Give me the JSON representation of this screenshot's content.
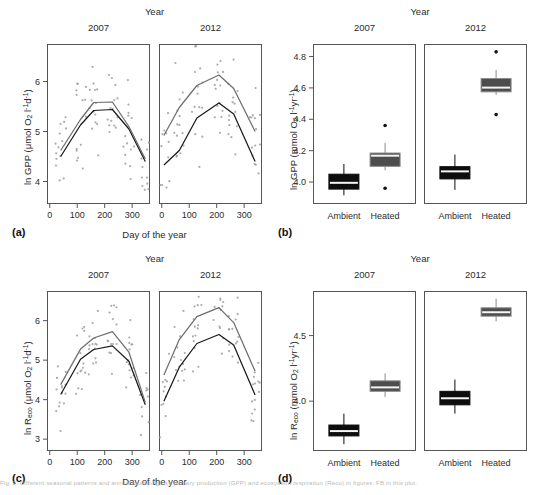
{
  "figure": {
    "caption": "Fig. 2. Different seasonal patterns and annual rates of gross primary production (GPP) and ecosystem respiration (Reco) in figures: FB in this plot.",
    "strip_title": "Year",
    "years": [
      "2007",
      "2012"
    ],
    "treatments": [
      "Ambient",
      "Heated"
    ]
  },
  "panels": [
    {
      "letter": "(a)",
      "xlabel": "Day of the year",
      "ylabel_html": "ln GPP (&mu;mol O<sub>2</sub> l<sup>-1</sup>d<sup>-1</sup>)",
      "xticks": [
        0,
        100,
        200,
        300
      ],
      "yticks": [
        4,
        5,
        6
      ]
    },
    {
      "letter": "(b)",
      "xlabel": "",
      "ylabel_html": "ln GPP (mmol O<sub>2</sub> l<sup>-1</sup>yr<sup>-1</sup>)",
      "xticks": [
        "Ambient",
        "Heated",
        "Ambient",
        "Heated"
      ],
      "yticks": [
        4.0,
        4.2,
        4.4,
        4.6,
        4.8
      ]
    },
    {
      "letter": "(c)",
      "xlabel": "Day of the year",
      "ylabel_html": "ln R<sub>eco</sub> (&mu;mol O<sub>2</sub> l<sup>-1</sup>d<sup>-1</sup>)",
      "xticks": [
        0,
        100,
        200,
        300
      ],
      "yticks": [
        3,
        4,
        5,
        6
      ]
    },
    {
      "letter": "(d)",
      "xlabel": "",
      "ylabel_html": "ln R<sub>eco</sub> (mmol O<sub>2</sub> l<sup>-1</sup>yr<sup>-1</sup>)",
      "xticks": [
        "Ambient",
        "Heated",
        "Ambient",
        "Heated"
      ],
      "yticks": [
        4.0,
        4.5
      ]
    }
  ],
  "chart_data": [
    {
      "panel": "a",
      "type": "line",
      "title": "ln GPP seasonal",
      "xlabel": "Day of the year",
      "ylabel": "ln GPP (umol O2 l-1 d-1)",
      "xlim": [
        -10,
        365
      ],
      "ylim": [
        3.55,
        6.75
      ],
      "facets": [
        "2007",
        "2012"
      ],
      "series": [
        {
          "name": "Ambient 2007",
          "color": "#1a1a1a",
          "facet": "2007",
          "x": [
            40,
            112,
            160,
            228,
            288,
            348
          ],
          "y": [
            4.5,
            5.13,
            5.42,
            5.44,
            5.05,
            4.4
          ]
        },
        {
          "name": "Heated 2007",
          "color": "#6e6e6e",
          "facet": "2007",
          "x": [
            40,
            112,
            160,
            228,
            288,
            348
          ],
          "y": [
            4.62,
            5.24,
            5.58,
            5.59,
            5.1,
            4.45
          ]
        },
        {
          "name": "Ambient 2012",
          "color": "#1a1a1a",
          "facet": "2012",
          "x": [
            8,
            64,
            128,
            208,
            262,
            340
          ],
          "y": [
            4.33,
            4.62,
            5.27,
            5.57,
            5.35,
            4.4
          ]
        },
        {
          "name": "Heated 2012",
          "color": "#6e6e6e",
          "facet": "2012",
          "x": [
            8,
            64,
            128,
            208,
            262,
            340
          ],
          "y": [
            4.92,
            5.48,
            5.92,
            6.13,
            5.86,
            5.0
          ]
        }
      ],
      "scatter_note": "grey jittered observation points around each sampling date"
    },
    {
      "panel": "b",
      "type": "boxplot",
      "title": "ln GPP annual",
      "ylabel": "ln GPP (mmol O2 l-1 yr-1)",
      "ylim": [
        3.86,
        4.88
      ],
      "yticks": [
        4.0,
        4.2,
        4.4,
        4.6,
        4.8
      ],
      "boxes": [
        {
          "facet": "2007",
          "group": "Ambient",
          "fill": "#0d0d0d",
          "lower_whisker": 3.915,
          "q1": 3.955,
          "median": 3.995,
          "q3": 4.05,
          "upper_whisker": 4.115,
          "outliers": []
        },
        {
          "facet": "2007",
          "group": "Heated",
          "fill": "#4d4d4d",
          "lower_whisker": 4.075,
          "q1": 4.1,
          "median": 4.168,
          "q3": 4.185,
          "upper_whisker": 4.25,
          "outliers": [
            4.36,
            3.96
          ]
        },
        {
          "facet": "2012",
          "group": "Ambient",
          "fill": "#0d0d0d",
          "lower_whisker": 3.95,
          "q1": 4.02,
          "median": 4.068,
          "q3": 4.098,
          "upper_whisker": 4.175,
          "outliers": []
        },
        {
          "facet": "2012",
          "group": "Heated",
          "fill": "#4d4d4d",
          "lower_whisker": 4.555,
          "q1": 4.575,
          "median": 4.602,
          "q3": 4.66,
          "upper_whisker": 4.715,
          "outliers": [
            4.83,
            4.43
          ]
        }
      ]
    },
    {
      "panel": "c",
      "type": "line",
      "title": "ln Reco seasonal",
      "xlabel": "Day of the year",
      "ylabel": "ln Reco (umol O2 l-1 d-1)",
      "xlim": [
        -10,
        365
      ],
      "ylim": [
        2.7,
        6.75
      ],
      "facets": [
        "2007",
        "2012"
      ],
      "series": [
        {
          "name": "Ambient 2007",
          "color": "#1a1a1a",
          "facet": "2007",
          "x": [
            40,
            112,
            160,
            228,
            288,
            348
          ],
          "y": [
            4.13,
            5.02,
            5.27,
            5.36,
            4.97,
            3.87
          ]
        },
        {
          "name": "Heated 2007",
          "color": "#6e6e6e",
          "facet": "2007",
          "x": [
            40,
            112,
            160,
            228,
            288,
            348
          ],
          "y": [
            4.38,
            5.28,
            5.56,
            5.72,
            5.2,
            3.93
          ]
        },
        {
          "name": "Ambient 2012",
          "color": "#1a1a1a",
          "facet": "2012",
          "x": [
            8,
            64,
            128,
            208,
            262,
            340
          ],
          "y": [
            3.96,
            4.82,
            5.42,
            5.65,
            5.38,
            4.12
          ]
        },
        {
          "name": "Heated 2012",
          "color": "#6e6e6e",
          "facet": "2012",
          "x": [
            8,
            64,
            128,
            208,
            262,
            340
          ],
          "y": [
            4.62,
            5.52,
            6.1,
            6.33,
            5.95,
            4.72
          ]
        }
      ],
      "scatter_note": "grey jittered observation points around each sampling date"
    },
    {
      "panel": "d",
      "type": "boxplot",
      "title": "ln Reco annual",
      "ylabel": "ln Reco (mmol O2 l-1 yr-1)",
      "ylim": [
        3.62,
        4.84
      ],
      "yticks": [
        4.0,
        4.5
      ],
      "boxes": [
        {
          "facet": "2007",
          "group": "Ambient",
          "fill": "#0d0d0d",
          "lower_whisker": 3.672,
          "q1": 3.735,
          "median": 3.772,
          "q3": 3.818,
          "upper_whisker": 3.905,
          "outliers": []
        },
        {
          "facet": "2007",
          "group": "Heated",
          "fill": "#4d4d4d",
          "lower_whisker": 4.032,
          "q1": 4.075,
          "median": 4.105,
          "q3": 4.155,
          "upper_whisker": 4.212,
          "outliers": []
        },
        {
          "facet": "2012",
          "group": "Ambient",
          "fill": "#0d0d0d",
          "lower_whisker": 3.905,
          "q1": 3.972,
          "median": 4.022,
          "q3": 4.075,
          "upper_whisker": 4.165,
          "outliers": []
        },
        {
          "facet": "2012",
          "group": "Heated",
          "fill": "#4d4d4d",
          "lower_whisker": 4.608,
          "q1": 4.648,
          "median": 4.678,
          "q3": 4.712,
          "upper_whisker": 4.782,
          "outliers": []
        }
      ]
    }
  ]
}
